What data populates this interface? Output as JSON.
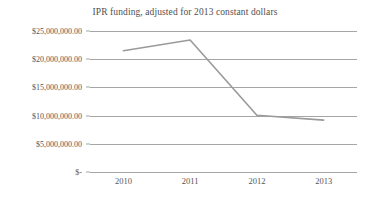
{
  "chart_data": {
    "type": "line",
    "title": "IPR funding, adjusted for 2013 constant dollars",
    "xlabel": "",
    "ylabel": "",
    "categories": [
      "2010",
      "2011",
      "2012",
      "2013"
    ],
    "series": [
      {
        "name": "IPR funding",
        "values": [
          21500000,
          23400000,
          10050000,
          9200000
        ],
        "color": "#9a9a9a"
      }
    ],
    "ylim": [
      0,
      25000000
    ],
    "ytick_values": [
      25000000,
      20000000,
      15000000,
      10000000,
      5000000,
      0
    ],
    "ytick_labels": [
      "$25,000,000.00",
      "$20,000,000.00",
      "$15,000,000.00",
      "$10,000,000.00",
      "$5,000,000.00",
      "$-"
    ],
    "grid": true,
    "grid_color": "#a6a6a6",
    "legend": false,
    "legend_position": "none",
    "background_color": "#ffffff",
    "text_color": "#555555"
  }
}
